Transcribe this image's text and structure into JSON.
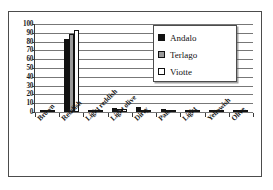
{
  "chart_data": {
    "type": "bar",
    "title": "",
    "subtitle": "",
    "xlabel": "",
    "ylabel": "",
    "ylim": [
      0,
      100
    ],
    "yticks": [
      0,
      10,
      20,
      30,
      40,
      50,
      60,
      70,
      80,
      90,
      100
    ],
    "grid": true,
    "legend_position": "top-right",
    "categories": [
      "Brown",
      "Reddish",
      "Light reddish",
      "Light olive",
      "Dirty",
      "Pale",
      "Light",
      "Yellowish",
      "Olive"
    ],
    "series": [
      {
        "name": "Andalo",
        "color": "#111111",
        "values": [
          2,
          83,
          1,
          4,
          6,
          3,
          1,
          0,
          1
        ]
      },
      {
        "name": "Terlago",
        "color": "#9a9a9a",
        "values": [
          0,
          89,
          1,
          3,
          0,
          1,
          1,
          1,
          1
        ]
      },
      {
        "name": "Viotte",
        "color": "#ffffff",
        "values": [
          0,
          93,
          1,
          3,
          0,
          1,
          0,
          1,
          1
        ]
      }
    ]
  },
  "legend": {
    "items": [
      {
        "label": "Andalo",
        "swatch": "filled-black-square"
      },
      {
        "label": "Terlago",
        "swatch": "filled-gray-square"
      },
      {
        "label": "Viotte",
        "swatch": "empty-white-square"
      }
    ]
  },
  "axes": {
    "y_tick_labels": [
      "100",
      "90",
      "80",
      "70",
      "60",
      "50",
      "40",
      "30",
      "20",
      "10",
      "0"
    ],
    "x_tick_labels": [
      "Brown",
      "Reddish",
      "Light reddish",
      "Light olive",
      "Dirty",
      "Pale",
      "Light",
      "Yellowish",
      "Olive"
    ]
  }
}
